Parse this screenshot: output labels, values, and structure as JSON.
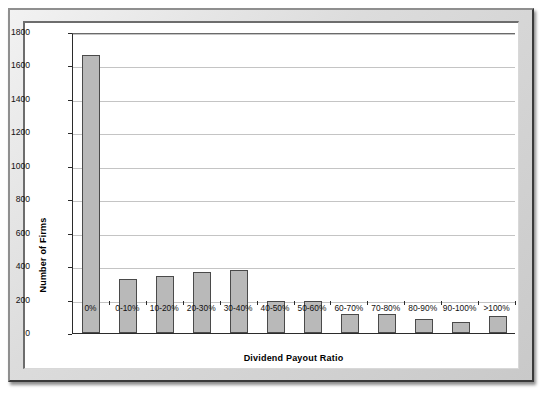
{
  "chart_data": {
    "type": "bar",
    "title": "",
    "xlabel": "Dividend Payout Ratio",
    "ylabel": "Number of Firms",
    "categories": [
      "0%",
      "0-10%",
      "10-20%",
      "20-30%",
      "30-40%",
      "40-50%",
      "50-60%",
      "60-70%",
      "70-80%",
      "80-90%",
      "90-100%",
      ">100%"
    ],
    "values": [
      1660,
      325,
      340,
      363,
      375,
      190,
      193,
      112,
      113,
      85,
      65,
      100
    ],
    "ylim": [
      0,
      1800
    ],
    "yticks": [
      0,
      200,
      400,
      600,
      800,
      1000,
      1200,
      1400,
      1600,
      1800
    ],
    "ytick_labels": [
      "0",
      "200",
      "400",
      "600",
      "800",
      "1000",
      "1200",
      "1400",
      "1600",
      "1800"
    ],
    "grid": true,
    "legend": "none",
    "series": [
      {
        "name": "Number of Firms",
        "values": [
          1660,
          325,
          340,
          363,
          375,
          190,
          193,
          112,
          113,
          85,
          65,
          100
        ]
      }
    ],
    "colors": {
      "bar_fill": "#b9b9b9",
      "bar_edge": "#4a4a4a",
      "gridline": "#c4c4c4",
      "axis": "#2b2b2b",
      "plot_background": "#ffffff",
      "frame": "#dcdcdc"
    }
  }
}
